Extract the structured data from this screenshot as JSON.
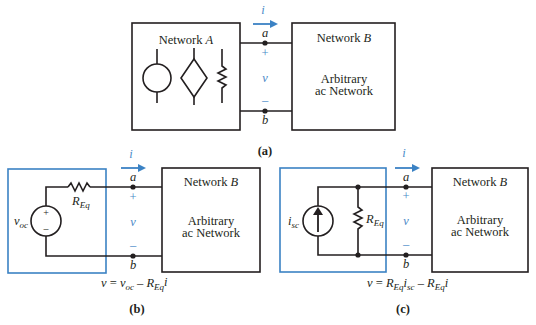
{
  "figure": {
    "colors": {
      "ink": "#231f20",
      "accent": "#3b82c4"
    },
    "common": {
      "current_label": "i",
      "terminal_a": "a",
      "terminal_b": "b",
      "plus": "+",
      "minus": "–",
      "voltage_label": "v",
      "network_b_title": "Network",
      "network_b_letter": "B",
      "network_b_line1": "Arbitrary",
      "network_b_line2": "ac Network"
    },
    "panel_a": {
      "caption": "(a)",
      "network_a_title": "Network",
      "network_a_letter": "A",
      "components": [
        "independent-source",
        "dependent-source",
        "resistor"
      ]
    },
    "panel_b": {
      "caption": "(b)",
      "source_label_main": "v",
      "source_label_sub": "oc",
      "source_plus": "+",
      "source_minus": "–",
      "resistor_main": "R",
      "resistor_sub": "Eq",
      "equation": {
        "lhs": "v",
        "eq": "=",
        "t1_main": "v",
        "t1_sub": "oc",
        "op": "–",
        "t2_main": "R",
        "t2_sub": "Eq",
        "t2_tail": "i"
      }
    },
    "panel_c": {
      "caption": "(c)",
      "source_label_main": "i",
      "source_label_sub": "sc",
      "resistor_main": "R",
      "resistor_sub": "Eq",
      "equation": {
        "lhs": "v",
        "eq": "=",
        "t1_main": "R",
        "t1_sub": "Eq",
        "t1_tail": "i",
        "t1_tail_sub": "sc",
        "op": "–",
        "t2_main": "R",
        "t2_sub": "Eq",
        "t2_tail": "i"
      }
    }
  }
}
